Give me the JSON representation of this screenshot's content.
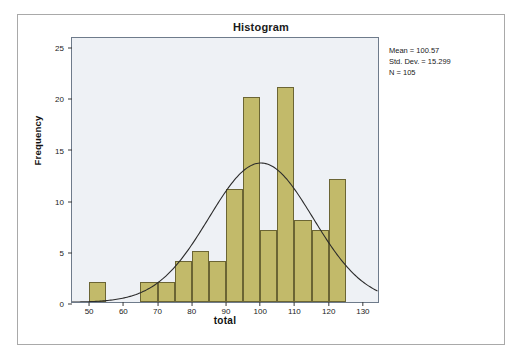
{
  "chart_data": {
    "type": "bar",
    "title": "Histogram",
    "xlabel": "total",
    "ylabel": "Frequency",
    "xlim": [
      45,
      135
    ],
    "ylim": [
      0,
      26
    ],
    "xticks": [
      50,
      60,
      70,
      80,
      90,
      100,
      110,
      120,
      130
    ],
    "yticks": [
      0,
      5,
      10,
      15,
      20,
      25
    ],
    "grid": false,
    "legend": "none",
    "bin_width": 5,
    "bin_starts": [
      50,
      55,
      60,
      65,
      70,
      75,
      80,
      85,
      90,
      95,
      100,
      105,
      110,
      115,
      120
    ],
    "categories": [
      "50-55",
      "55-60",
      "60-65",
      "65-70",
      "70-75",
      "75-80",
      "80-85",
      "85-90",
      "90-95",
      "95-100",
      "100-105",
      "105-110",
      "110-115",
      "115-120",
      "120-125"
    ],
    "values": [
      2,
      0,
      0,
      2,
      2,
      4,
      5,
      4,
      11,
      20,
      7,
      21,
      8,
      7,
      12
    ],
    "bar_color": "#c2ba6a",
    "bar_edge_color": "#6b6534",
    "plot_background": "#eef1f5",
    "overlay": {
      "type": "normal-curve",
      "mean": 100.57,
      "std_dev": 15.299,
      "n": 105,
      "peak_value": 13.7,
      "color": "#2b2b2b"
    },
    "annotations": [
      "Mean = 100.57",
      "Std. Dev. = 15.299",
      "N = 105"
    ]
  },
  "stats": {
    "mean_line": "Mean = 100.57",
    "stddev_line": "Std. Dev. = 15.299",
    "n_line": "N = 105"
  }
}
